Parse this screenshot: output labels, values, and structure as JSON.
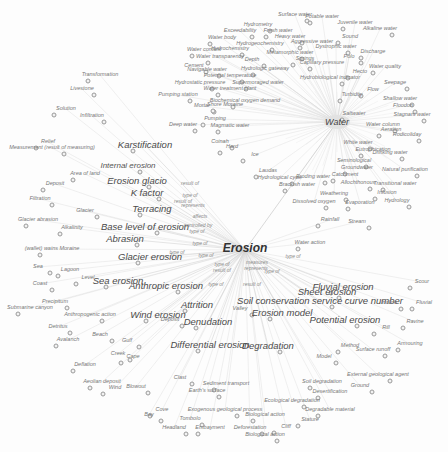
{
  "diagram": {
    "type": "concept-network",
    "central_node": {
      "label": "Erosion",
      "sub_label": "Erosion",
      "x": 245,
      "y": 250
    },
    "secondary_hub": {
      "label": "Water",
      "x": 337,
      "y": 122
    },
    "colors": {
      "background": "#fdfdfd",
      "edge": "#d4d4d4",
      "text": "#5a5a5a",
      "hub_text": "#333333"
    },
    "labels": [
      {
        "t": "Surface water",
        "x": 295,
        "y": 15,
        "c": "s"
      },
      {
        "t": "Potable water",
        "x": 322,
        "y": 17,
        "c": "s"
      },
      {
        "t": "Hydrometry",
        "x": 258,
        "y": 25,
        "c": "s"
      },
      {
        "t": "Juvenile water",
        "x": 355,
        "y": 23,
        "c": "s"
      },
      {
        "t": "Exceedability",
        "x": 240,
        "y": 31,
        "c": "s"
      },
      {
        "t": "Fresh water",
        "x": 278,
        "y": 31,
        "c": "s"
      },
      {
        "t": "Alkaline water",
        "x": 380,
        "y": 29,
        "c": "s"
      },
      {
        "t": "Water body",
        "x": 222,
        "y": 38,
        "c": "s"
      },
      {
        "t": "Heavy water",
        "x": 290,
        "y": 37,
        "c": "s"
      },
      {
        "t": "Sound",
        "x": 350,
        "y": 37,
        "c": "s"
      },
      {
        "t": "Hydrogeochemistry",
        "x": 260,
        "y": 44,
        "c": "s"
      },
      {
        "t": "Aggressive water",
        "x": 312,
        "y": 42,
        "c": "s"
      },
      {
        "t": "Dystrophic water",
        "x": 336,
        "y": 47,
        "c": "s"
      },
      {
        "t": "Water content",
        "x": 204,
        "y": 50,
        "c": "s"
      },
      {
        "t": "Hydrochemistry",
        "x": 230,
        "y": 49,
        "c": "s"
      },
      {
        "t": "Discharge",
        "x": 373,
        "y": 52,
        "c": "s"
      },
      {
        "t": "Metamorphic water",
        "x": 290,
        "y": 53,
        "c": "s"
      },
      {
        "t": "Water transparency",
        "x": 220,
        "y": 57,
        "c": "s"
      },
      {
        "t": "Depth",
        "x": 252,
        "y": 60,
        "c": "s"
      },
      {
        "t": "Springs",
        "x": 305,
        "y": 59,
        "c": "s"
      },
      {
        "t": "Polo",
        "x": 349,
        "y": 57,
        "c": "s"
      },
      {
        "t": "Capillary pressure",
        "x": 322,
        "y": 63,
        "c": "s"
      },
      {
        "t": "Cement",
        "x": 194,
        "y": 66,
        "c": "s"
      },
      {
        "t": "Water quality",
        "x": 385,
        "y": 67,
        "c": "s"
      },
      {
        "t": "Navigable water",
        "x": 207,
        "y": 70,
        "c": "s"
      },
      {
        "t": "Hydrologic gateway",
        "x": 265,
        "y": 69,
        "c": "s"
      },
      {
        "t": "Potential temperature",
        "x": 230,
        "y": 76,
        "c": "s"
      },
      {
        "t": "Hecto",
        "x": 360,
        "y": 72,
        "c": "s"
      },
      {
        "t": "Hydrobiological indicator",
        "x": 330,
        "y": 78,
        "c": "s"
      },
      {
        "t": "Transformation",
        "x": 100,
        "y": 75,
        "c": "s"
      },
      {
        "t": "Hydrostatic pressure",
        "x": 200,
        "y": 83,
        "c": "s"
      },
      {
        "t": "Supermoraged water",
        "x": 258,
        "y": 83,
        "c": "s"
      },
      {
        "t": "Seepage",
        "x": 395,
        "y": 83,
        "c": "s"
      },
      {
        "t": "Water treatment plant",
        "x": 230,
        "y": 89,
        "c": "s"
      },
      {
        "t": "Livestone",
        "x": 82,
        "y": 89,
        "c": "s"
      },
      {
        "t": "Flow",
        "x": 373,
        "y": 90,
        "c": "s"
      },
      {
        "t": "Pumping station",
        "x": 178,
        "y": 95,
        "c": "s"
      },
      {
        "t": "Turbidity",
        "x": 352,
        "y": 95,
        "c": "s"
      },
      {
        "t": "Shallow water",
        "x": 400,
        "y": 99,
        "c": "s"
      },
      {
        "t": "Biochemical oxygen demand",
        "x": 245,
        "y": 101,
        "c": "s"
      },
      {
        "t": "Mortar",
        "x": 202,
        "y": 106,
        "c": "s"
      },
      {
        "t": "Shore Moraine",
        "x": 225,
        "y": 105,
        "c": "s"
      },
      {
        "t": "Floodon",
        "x": 403,
        "y": 106,
        "c": "s"
      },
      {
        "t": "Solution",
        "x": 66,
        "y": 109,
        "c": "s"
      },
      {
        "t": "Infiltration",
        "x": 92,
        "y": 116,
        "c": "s"
      },
      {
        "t": "Saltwater",
        "x": 354,
        "y": 114,
        "c": "s"
      },
      {
        "t": "Stagnant water",
        "x": 412,
        "y": 115,
        "c": "s"
      },
      {
        "t": "Pumping",
        "x": 215,
        "y": 119,
        "c": "s"
      },
      {
        "t": "Deep water",
        "x": 183,
        "y": 125,
        "c": "s"
      },
      {
        "t": "Magmatic water",
        "x": 230,
        "y": 126,
        "c": "s"
      },
      {
        "t": "Water column",
        "x": 383,
        "y": 125,
        "c": "s"
      },
      {
        "t": "Aeration",
        "x": 391,
        "y": 130,
        "c": "s"
      },
      {
        "t": "Rodicoliday",
        "x": 407,
        "y": 135,
        "c": "s"
      },
      {
        "t": "Relief",
        "x": 48,
        "y": 142,
        "c": "s"
      },
      {
        "t": "Measurement (result of measuring)",
        "x": 52,
        "y": 148,
        "c": "s"
      },
      {
        "t": "Karstification",
        "x": 145,
        "y": 145,
        "c": "l"
      },
      {
        "t": "Coinah",
        "x": 220,
        "y": 142,
        "c": "s"
      },
      {
        "t": "Hard",
        "x": 232,
        "y": 147,
        "c": "s"
      },
      {
        "t": "White water",
        "x": 358,
        "y": 143,
        "c": "s"
      },
      {
        "t": "Eutrophication",
        "x": 373,
        "y": 150,
        "c": "s"
      },
      {
        "t": "Drinking water",
        "x": 390,
        "y": 153,
        "c": "s"
      },
      {
        "t": "Ice",
        "x": 255,
        "y": 155,
        "c": "s"
      },
      {
        "t": "Internal erosion",
        "x": 128,
        "y": 166,
        "c": "m"
      },
      {
        "t": "Area of land",
        "x": 85,
        "y": 174,
        "c": "s"
      },
      {
        "t": "Seminological",
        "x": 354,
        "y": 161,
        "c": "s"
      },
      {
        "t": "Groundwater",
        "x": 357,
        "y": 168,
        "c": "s"
      },
      {
        "t": "Natural purification",
        "x": 405,
        "y": 170,
        "c": "s"
      },
      {
        "t": "Laudas",
        "x": 268,
        "y": 171,
        "c": "s"
      },
      {
        "t": "Hydrological cycle",
        "x": 280,
        "y": 178,
        "c": "s"
      },
      {
        "t": "Catchment",
        "x": 345,
        "y": 175,
        "c": "s"
      },
      {
        "t": "Eroding water",
        "x": 313,
        "y": 177,
        "c": "s"
      },
      {
        "t": "Deposit",
        "x": 55,
        "y": 184,
        "c": "s"
      },
      {
        "t": "Erosion glacio",
        "x": 137,
        "y": 181,
        "c": "l"
      },
      {
        "t": "Brackish water",
        "x": 297,
        "y": 185,
        "c": "s"
      },
      {
        "t": "Allochthonous",
        "x": 358,
        "y": 183,
        "c": "s"
      },
      {
        "t": "Transitional water",
        "x": 395,
        "y": 184,
        "c": "s"
      },
      {
        "t": "K factor",
        "x": 147,
        "y": 193,
        "c": "l"
      },
      {
        "t": "result of",
        "x": 190,
        "y": 183,
        "c": "rel"
      },
      {
        "t": "Filtration",
        "x": 40,
        "y": 199,
        "c": "s"
      },
      {
        "t": "type of",
        "x": 190,
        "y": 195,
        "c": "rel"
      },
      {
        "t": "Weathering",
        "x": 334,
        "y": 194,
        "c": "s"
      },
      {
        "t": "Infusion",
        "x": 387,
        "y": 193,
        "c": "s"
      },
      {
        "t": "result of",
        "x": 183,
        "y": 201,
        "c": "rel"
      },
      {
        "t": "represents",
        "x": 193,
        "y": 205,
        "c": "rel"
      },
      {
        "t": "Dissolved oxygen",
        "x": 314,
        "y": 202,
        "c": "s"
      },
      {
        "t": "Evaporation",
        "x": 360,
        "y": 203,
        "c": "s"
      },
      {
        "t": "Hydrology",
        "x": 397,
        "y": 201,
        "c": "s"
      },
      {
        "t": "Terracing",
        "x": 152,
        "y": 209,
        "c": "l"
      },
      {
        "t": "Glacier",
        "x": 85,
        "y": 211,
        "c": "s"
      },
      {
        "t": "Glacier abrasion",
        "x": 38,
        "y": 220,
        "c": "s"
      },
      {
        "t": "affects",
        "x": 200,
        "y": 216,
        "c": "rel"
      },
      {
        "t": "Rainfall",
        "x": 330,
        "y": 220,
        "c": "s"
      },
      {
        "t": "Stream",
        "x": 357,
        "y": 222,
        "c": "s"
      },
      {
        "t": "Alkalinity",
        "x": 72,
        "y": 228,
        "c": "s"
      },
      {
        "t": "Base level of erosion",
        "x": 145,
        "y": 227,
        "c": "l"
      },
      {
        "t": "controlled by",
        "x": 198,
        "y": 225,
        "c": "rel"
      },
      {
        "t": "type of",
        "x": 197,
        "y": 231,
        "c": "rel"
      },
      {
        "t": "Erosion",
        "x": 245,
        "y": 248,
        "c": "hub"
      },
      {
        "t": "Abrasion",
        "x": 125,
        "y": 239,
        "c": "l"
      },
      {
        "t": "Water action",
        "x": 310,
        "y": 243,
        "c": "s"
      },
      {
        "t": "type of",
        "x": 200,
        "y": 243,
        "c": "rel"
      },
      {
        "t": "(wallet) wains  Moraine",
        "x": 52,
        "y": 249,
        "c": "s"
      },
      {
        "t": "type of",
        "x": 177,
        "y": 252,
        "c": "rel"
      },
      {
        "t": "type of",
        "x": 206,
        "y": 255,
        "c": "rel"
      },
      {
        "t": "type of",
        "x": 293,
        "y": 256,
        "c": "rel"
      },
      {
        "t": "Glacier erosion",
        "x": 150,
        "y": 257,
        "c": "l"
      },
      {
        "t": "Sea",
        "x": 38,
        "y": 267,
        "c": "s"
      },
      {
        "t": "Lagoon",
        "x": 70,
        "y": 270,
        "c": "s"
      },
      {
        "t": "type of",
        "x": 222,
        "y": 264,
        "c": "rel"
      },
      {
        "t": "measures",
        "x": 257,
        "y": 262,
        "c": "rel"
      },
      {
        "t": "result of",
        "x": 222,
        "y": 270,
        "c": "rel"
      },
      {
        "t": "represents",
        "x": 256,
        "y": 268,
        "c": "rel"
      },
      {
        "t": "type of",
        "x": 272,
        "y": 271,
        "c": "rel"
      },
      {
        "t": "Level",
        "x": 88,
        "y": 278,
        "c": "s"
      },
      {
        "t": "Coast",
        "x": 40,
        "y": 284,
        "c": "s"
      },
      {
        "t": "Sea erosion",
        "x": 118,
        "y": 281,
        "c": "l"
      },
      {
        "t": "Anthropic erosion",
        "x": 166,
        "y": 286,
        "c": "l"
      },
      {
        "t": "type of",
        "x": 216,
        "y": 284,
        "c": "rel"
      },
      {
        "t": "result of",
        "x": 252,
        "y": 284,
        "c": "rel"
      },
      {
        "t": "Fluvial erosion",
        "x": 343,
        "y": 287,
        "c": "l"
      },
      {
        "t": "Sheet erosion",
        "x": 327,
        "y": 292,
        "c": "l"
      },
      {
        "t": "Scour",
        "x": 422,
        "y": 282,
        "c": "s"
      },
      {
        "t": "Precipitum",
        "x": 55,
        "y": 302,
        "c": "s"
      },
      {
        "t": "Submarine canyon",
        "x": 30,
        "y": 308,
        "c": "s"
      },
      {
        "t": "Soil conservation service curve number",
        "x": 320,
        "y": 301,
        "c": "l"
      },
      {
        "t": "Attrition",
        "x": 197,
        "y": 305,
        "c": "l"
      },
      {
        "t": "Incline",
        "x": 389,
        "y": 303,
        "c": "s"
      },
      {
        "t": "Fluvial",
        "x": 424,
        "y": 303,
        "c": "s"
      },
      {
        "t": "Anthropogenic action",
        "x": 90,
        "y": 315,
        "c": "s"
      },
      {
        "t": "Wind erosion",
        "x": 158,
        "y": 315,
        "c": "l"
      },
      {
        "t": "Valley",
        "x": 240,
        "y": 309,
        "c": "s"
      },
      {
        "t": "Erosion model",
        "x": 282,
        "y": 313,
        "c": "l"
      },
      {
        "t": "Potential erosion",
        "x": 345,
        "y": 320,
        "c": "l"
      },
      {
        "t": "Denudation",
        "x": 208,
        "y": 322,
        "c": "l"
      },
      {
        "t": "Deposit",
        "x": 170,
        "y": 320,
        "c": "s"
      },
      {
        "t": "Ravine",
        "x": 415,
        "y": 322,
        "c": "s"
      },
      {
        "t": "Detritus",
        "x": 58,
        "y": 327,
        "c": "s"
      },
      {
        "t": "Rill",
        "x": 386,
        "y": 328,
        "c": "s"
      },
      {
        "t": "Beach",
        "x": 100,
        "y": 335,
        "c": "s"
      },
      {
        "t": "Avalanch",
        "x": 68,
        "y": 340,
        "c": "s"
      },
      {
        "t": "Gulf",
        "x": 127,
        "y": 341,
        "c": "s"
      },
      {
        "t": "Differential erosion",
        "x": 210,
        "y": 345,
        "c": "l"
      },
      {
        "t": "Degradation",
        "x": 268,
        "y": 346,
        "c": "l"
      },
      {
        "t": "Method",
        "x": 350,
        "y": 346,
        "c": "s"
      },
      {
        "t": "Surface runoff",
        "x": 373,
        "y": 350,
        "c": "s"
      },
      {
        "t": "Armouring",
        "x": 410,
        "y": 344,
        "c": "s"
      },
      {
        "t": "Creek",
        "x": 118,
        "y": 354,
        "c": "s"
      },
      {
        "t": "Cape",
        "x": 133,
        "y": 357,
        "c": "s"
      },
      {
        "t": "Model",
        "x": 324,
        "y": 357,
        "c": "s"
      },
      {
        "t": "Deflation",
        "x": 85,
        "y": 365,
        "c": "s"
      },
      {
        "t": "External geological agent",
        "x": 378,
        "y": 375,
        "c": "s"
      },
      {
        "t": "Aeolian deposit",
        "x": 102,
        "y": 382,
        "c": "s"
      },
      {
        "t": "Clast",
        "x": 180,
        "y": 378,
        "c": "s"
      },
      {
        "t": "Soil degradation",
        "x": 322,
        "y": 382,
        "c": "s"
      },
      {
        "t": "Ground",
        "x": 360,
        "y": 386,
        "c": "s"
      },
      {
        "t": "Wind",
        "x": 115,
        "y": 388,
        "c": "s"
      },
      {
        "t": "Blowout",
        "x": 136,
        "y": 387,
        "c": "s"
      },
      {
        "t": "Sediment transport",
        "x": 226,
        "y": 384,
        "c": "s"
      },
      {
        "t": "Earth's surface",
        "x": 207,
        "y": 391,
        "c": "s"
      },
      {
        "t": "Desertification",
        "x": 330,
        "y": 392,
        "c": "s"
      },
      {
        "t": "Ecological degradation",
        "x": 292,
        "y": 401,
        "c": "s"
      },
      {
        "t": "Cove",
        "x": 162,
        "y": 410,
        "c": "s"
      },
      {
        "t": "Exogenous geological process",
        "x": 225,
        "y": 410,
        "c": "s"
      },
      {
        "t": "Degradable material",
        "x": 330,
        "y": 410,
        "c": "s"
      },
      {
        "t": "Bay",
        "x": 149,
        "y": 415,
        "c": "s"
      },
      {
        "t": "Biological action",
        "x": 265,
        "y": 415,
        "c": "s"
      },
      {
        "t": "Tombolo",
        "x": 190,
        "y": 419,
        "c": "s"
      },
      {
        "t": "Stature",
        "x": 310,
        "y": 420,
        "c": "s"
      },
      {
        "t": "Headland",
        "x": 174,
        "y": 428,
        "c": "s"
      },
      {
        "t": "Embayment",
        "x": 210,
        "y": 428,
        "c": "s"
      },
      {
        "t": "Deforestation",
        "x": 250,
        "y": 428,
        "c": "s"
      },
      {
        "t": "Cliff",
        "x": 286,
        "y": 427,
        "c": "s"
      },
      {
        "t": "Biological action",
        "x": 265,
        "y": 435,
        "c": "s"
      }
    ]
  }
}
